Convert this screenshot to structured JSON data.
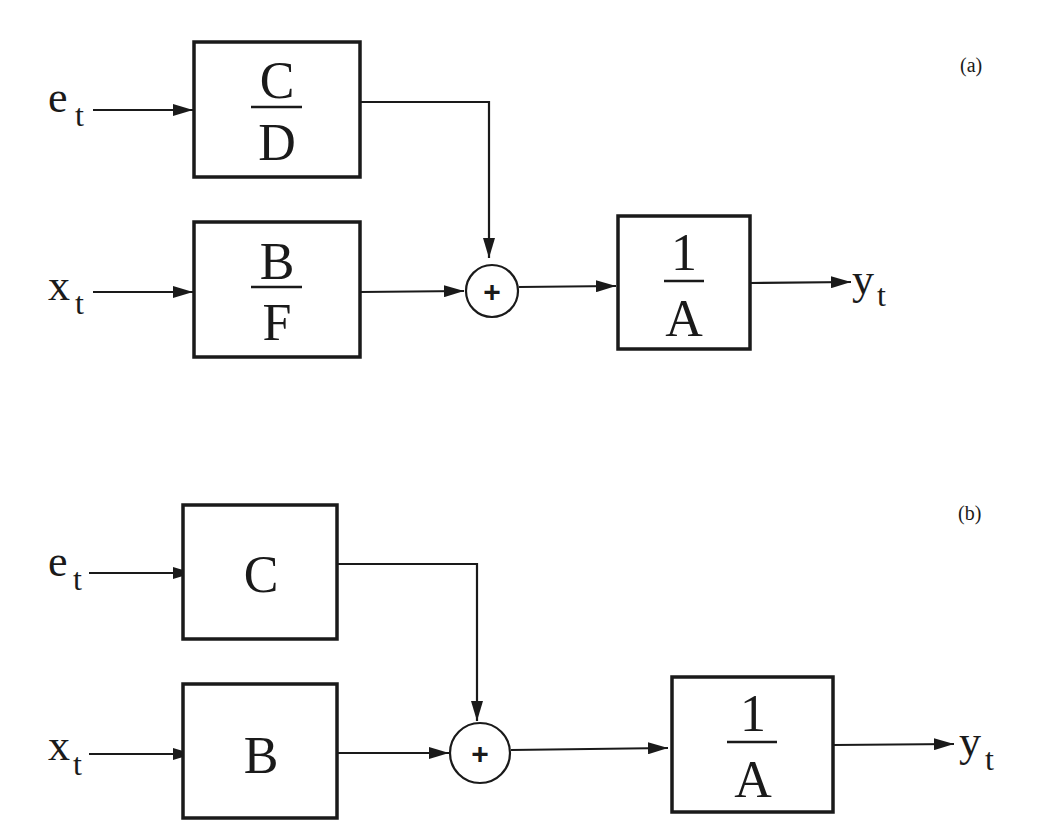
{
  "diagram": {
    "panels": [
      {
        "id": "a",
        "label": "(a)",
        "inputs": [
          {
            "symbol": "e",
            "subscript": "t"
          },
          {
            "symbol": "x",
            "subscript": "t"
          }
        ],
        "upper_block": {
          "numerator": "C",
          "denominator": "D"
        },
        "lower_block": {
          "numerator": "B",
          "denominator": "F"
        },
        "sum_symbol": "+",
        "output_block": {
          "numerator": "1",
          "denominator": "A"
        },
        "output": {
          "symbol": "y",
          "subscript": "t"
        }
      },
      {
        "id": "b",
        "label": "(b)",
        "inputs": [
          {
            "symbol": "e",
            "subscript": "t"
          },
          {
            "symbol": "x",
            "subscript": "t"
          }
        ],
        "upper_block": {
          "label": "C"
        },
        "lower_block": {
          "label": "B"
        },
        "sum_symbol": "+",
        "output_block": {
          "numerator": "1",
          "denominator": "A"
        },
        "output": {
          "symbol": "y",
          "subscript": "t"
        }
      }
    ]
  }
}
